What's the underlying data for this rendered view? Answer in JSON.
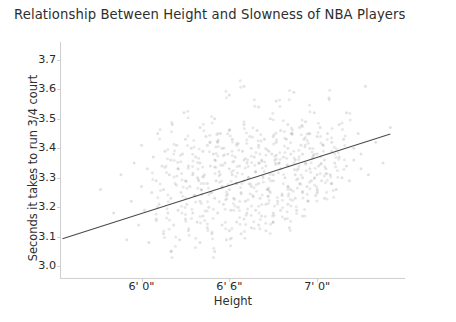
{
  "chart_data": {
    "type": "scatter",
    "title": "Relationship Between Height and Slowness of NBA Players",
    "xlabel": "Height",
    "ylabel": "Seconds it takes to run 3/4 court",
    "grid": false,
    "legend": "none",
    "xlim": [
      66.5,
      90.0
    ],
    "ylim": [
      2.96,
      3.76
    ],
    "xtick_values": [
      72,
      78,
      84
    ],
    "xtick_labels": [
      "6' 0\"",
      "6' 6\"",
      "7' 0\""
    ],
    "ytick_values": [
      3.0,
      3.1,
      3.2,
      3.3,
      3.4,
      3.5,
      3.6,
      3.7
    ],
    "ytick_labels": [
      "3.0",
      "3.1",
      "3.2",
      "3.3",
      "3.4",
      "3.5",
      "3.6",
      "3.7"
    ],
    "point_color": "#7b7b7b",
    "point_alpha": 0.22,
    "point_radius": 1.5,
    "line_color": "#4a4a4a",
    "trendline": {
      "label": "linear fit",
      "x_start": 66.6,
      "y_start": 3.093,
      "x_end": 89.0,
      "y_end": 3.448,
      "slope": 0.01585,
      "intercept": 2.0375
    },
    "x": [
      69.2,
      70.1,
      70.6,
      71.0,
      71.3,
      71.5,
      71.8,
      72.0,
      72.0,
      72.2,
      72.4,
      72.5,
      72.7,
      72.8,
      73.0,
      73.0,
      73.1,
      73.2,
      73.4,
      73.5,
      73.5,
      73.6,
      73.8,
      73.9,
      74.0,
      74.0,
      74.0,
      74.1,
      74.2,
      74.3,
      74.4,
      74.5,
      74.5,
      74.6,
      74.7,
      74.8,
      74.9,
      75.0,
      75.0,
      75.0,
      75.1,
      75.2,
      75.2,
      75.3,
      75.4,
      75.5,
      75.5,
      75.6,
      75.7,
      75.8,
      75.9,
      76.0,
      76.0,
      76.0,
      76.0,
      76.1,
      76.2,
      76.2,
      76.3,
      76.4,
      76.5,
      76.5,
      76.5,
      76.6,
      76.7,
      76.8,
      76.8,
      76.9,
      77.0,
      77.0,
      77.0,
      77.0,
      77.1,
      77.2,
      77.2,
      77.3,
      77.4,
      77.5,
      77.5,
      77.5,
      77.6,
      77.7,
      77.8,
      77.8,
      77.9,
      78.0,
      78.0,
      78.0,
      78.0,
      78.0,
      78.1,
      78.2,
      78.2,
      78.3,
      78.4,
      78.5,
      78.5,
      78.5,
      78.6,
      78.7,
      78.8,
      78.8,
      78.9,
      79.0,
      79.0,
      79.0,
      79.0,
      79.0,
      79.1,
      79.2,
      79.2,
      79.3,
      79.4,
      79.5,
      79.5,
      79.5,
      79.6,
      79.7,
      79.8,
      79.8,
      79.9,
      80.0,
      80.0,
      80.0,
      80.0,
      80.0,
      80.1,
      80.2,
      80.2,
      80.3,
      80.4,
      80.5,
      80.5,
      80.5,
      80.6,
      80.7,
      80.8,
      80.8,
      80.9,
      81.0,
      81.0,
      81.0,
      81.0,
      81.0,
      81.1,
      81.2,
      81.2,
      81.3,
      81.4,
      81.5,
      81.5,
      81.5,
      81.6,
      81.7,
      81.8,
      81.8,
      81.9,
      82.0,
      82.0,
      82.0,
      82.0,
      82.0,
      82.1,
      82.2,
      82.2,
      82.3,
      82.4,
      82.5,
      82.5,
      82.5,
      82.6,
      82.7,
      82.8,
      82.8,
      82.9,
      83.0,
      83.0,
      83.0,
      83.0,
      83.1,
      83.2,
      83.2,
      83.3,
      83.4,
      83.5,
      83.5,
      83.5,
      83.6,
      83.7,
      83.8,
      83.9,
      84.0,
      84.0,
      84.0,
      84.0,
      84.1,
      84.2,
      84.3,
      84.4,
      84.5,
      84.5,
      84.6,
      84.7,
      84.8,
      84.9,
      85.0,
      85.0,
      85.0,
      85.2,
      85.3,
      85.5,
      85.5,
      85.7,
      85.8,
      86.0,
      86.0,
      86.2,
      86.5,
      86.5,
      86.8,
      87.0,
      87.0,
      87.3,
      87.5,
      88.0,
      88.5,
      89.0
    ],
    "y": [
      3.26,
      3.18,
      3.31,
      3.09,
      3.22,
      3.35,
      3.14,
      3.27,
      3.41,
      3.19,
      3.33,
      3.08,
      3.25,
      3.37,
      3.16,
      3.29,
      3.45,
      3.21,
      3.34,
      3.11,
      3.26,
      3.39,
      3.18,
      3.31,
      3.05,
      3.23,
      3.36,
      3.48,
      3.14,
      3.28,
      3.41,
      3.19,
      3.33,
      3.09,
      3.25,
      3.38,
      3.52,
      3.16,
      3.29,
      3.43,
      3.21,
      3.34,
      3.12,
      3.27,
      3.4,
      3.18,
      3.31,
      3.24,
      3.37,
      3.15,
      3.29,
      3.08,
      3.22,
      3.35,
      3.47,
      3.26,
      3.39,
      3.17,
      3.31,
      3.44,
      3.13,
      3.28,
      3.41,
      3.2,
      3.34,
      3.11,
      3.25,
      3.38,
      3.05,
      3.23,
      3.36,
      3.5,
      3.29,
      3.42,
      3.18,
      3.32,
      3.45,
      3.14,
      3.27,
      3.4,
      3.21,
      3.35,
      3.09,
      3.24,
      3.38,
      3.12,
      3.26,
      3.33,
      3.46,
      3.58,
      3.19,
      3.31,
      3.43,
      3.23,
      3.37,
      3.15,
      3.28,
      3.41,
      3.2,
      3.34,
      3.11,
      3.25,
      3.39,
      3.16,
      3.29,
      3.36,
      3.48,
      3.61,
      3.22,
      3.35,
      3.18,
      3.3,
      3.44,
      3.13,
      3.27,
      3.4,
      3.24,
      3.37,
      3.19,
      3.32,
      3.46,
      3.14,
      3.28,
      3.35,
      3.41,
      3.54,
      3.23,
      3.36,
      3.17,
      3.3,
      3.43,
      3.21,
      3.34,
      3.12,
      3.26,
      3.39,
      3.5,
      3.25,
      3.38,
      3.18,
      3.31,
      3.44,
      3.15,
      3.29,
      3.36,
      3.42,
      3.56,
      3.22,
      3.35,
      3.19,
      3.33,
      3.46,
      3.24,
      3.37,
      3.16,
      3.3,
      3.43,
      3.27,
      3.4,
      3.21,
      3.34,
      3.48,
      3.13,
      3.26,
      3.38,
      3.45,
      3.59,
      3.31,
      3.23,
      3.36,
      3.19,
      3.33,
      3.47,
      3.28,
      3.41,
      3.25,
      3.38,
      3.17,
      3.3,
      3.43,
      3.35,
      3.49,
      3.27,
      3.22,
      3.4,
      3.33,
      3.45,
      3.29,
      3.37,
      3.52,
      3.24,
      3.31,
      3.44,
      3.26,
      3.38,
      3.34,
      3.47,
      3.29,
      3.41,
      3.36,
      3.23,
      3.33,
      3.45,
      3.57,
      3.31,
      3.39,
      3.28,
      3.42,
      3.35,
      3.26,
      3.48,
      3.37,
      3.3,
      3.43,
      3.34,
      3.52,
      3.29,
      3.4,
      3.36,
      3.45,
      3.33,
      3.38,
      3.61,
      3.31,
      3.42,
      3.35,
      3.47,
      3.39,
      3.44,
      3.37,
      3.41
    ]
  }
}
